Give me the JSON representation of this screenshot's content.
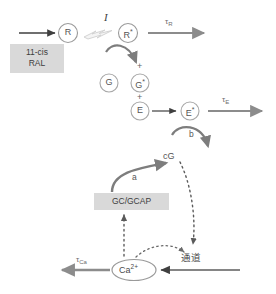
{
  "figure": {
    "background_color": "#ffffff",
    "width": 276,
    "height": 294
  },
  "colors": {
    "dark_arrow": "#3f3f3f",
    "gray_arrow": "#8c8c8c",
    "curved_arrow": "#7d7d7d",
    "node_stroke": "#9a9a9a",
    "text": "#4a4a4a",
    "box_fill": "#d9d9d9",
    "dotted": "#5a5a5a",
    "flash_fill": "#f2f2f2",
    "flash_stroke": "#cfcfcf"
  },
  "nodes": {
    "r": {
      "label": "R",
      "shape": "circle"
    },
    "r_star": {
      "label": "R",
      "superscript": "*",
      "shape": "circle"
    },
    "g": {
      "label": "G",
      "shape": "circle"
    },
    "g_star": {
      "label": "G",
      "superscript": "*",
      "shape": "circle"
    },
    "e": {
      "label": "E",
      "shape": "circle"
    },
    "e_star": {
      "label": "E",
      "superscript": "*",
      "shape": "circle"
    },
    "cg": {
      "label": "cG",
      "shape": "plain"
    },
    "calcium": {
      "label": "Ca",
      "superscript": "2+",
      "shape": "ellipse"
    }
  },
  "boxes": {
    "retinal": {
      "line1": "11-cis",
      "line2": "RAL"
    },
    "gc_gcap": {
      "label": "GC/GCAP"
    }
  },
  "operators": {
    "plus_above_g_star": "+",
    "plus_below_g_star": "+"
  },
  "rate_labels": {
    "tau_r": {
      "base": "τ",
      "sub": "R"
    },
    "tau_e": {
      "base": "τ",
      "sub": "E"
    },
    "tau_ca": {
      "base": "τ",
      "sub": "Ca"
    }
  },
  "reaction_labels": {
    "light": "I",
    "a": "a",
    "b": "b"
  },
  "channel": {
    "label": "通道"
  },
  "icons": {
    "light_flash": "lightning-flash-icon"
  }
}
